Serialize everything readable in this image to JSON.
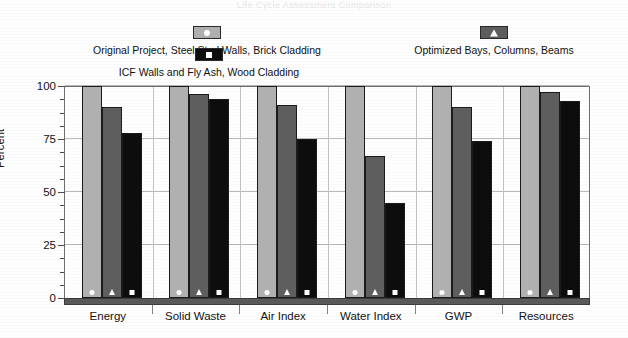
{
  "cropped_title_fragment": "Life Cycle Assessment Comparison",
  "legend": {
    "entries": [
      {
        "id": "e0",
        "label": "Original Project, Steel Stud Walls, Brick Cladding",
        "marker": "circle",
        "color": "#b0b0b0"
      },
      {
        "id": "e1",
        "label": "ICF Walls and Fly Ash, Wood Cladding",
        "marker": "square",
        "color": "#0d0d0d"
      },
      {
        "id": "e2",
        "label": "Optimized Bays, Columns, Beams",
        "marker": "triangle",
        "color": "#5e5e5e"
      }
    ]
  },
  "chart_data": {
    "type": "bar",
    "title": "",
    "xlabel": "",
    "ylabel": "Percent",
    "ylim": [
      0,
      100
    ],
    "yticks": [
      0,
      25,
      50,
      75,
      100
    ],
    "ytick_labels": [
      "0",
      "25",
      "50",
      "75",
      "100"
    ],
    "minor_tick_step": 6.25,
    "grid": true,
    "legend_position": "top",
    "categories": [
      "Energy",
      "Solid Waste",
      "Air Index",
      "Water Index",
      "GWP",
      "Resources"
    ],
    "series": [
      {
        "name": "Original Project, Steel Stud Walls, Brick Cladding",
        "marker": "circle",
        "color": "#b0b0b0",
        "values": [
          100,
          100,
          100,
          100,
          100,
          100
        ]
      },
      {
        "name": "Optimized Bays, Columns, Beams",
        "marker": "triangle",
        "color": "#5e5e5e",
        "values": [
          90,
          96,
          91,
          67,
          90,
          97
        ]
      },
      {
        "name": "ICF Walls and Fly Ash, Wood Cladding",
        "marker": "square",
        "color": "#0d0d0d",
        "values": [
          78,
          94,
          75,
          45,
          74,
          93
        ]
      }
    ]
  }
}
